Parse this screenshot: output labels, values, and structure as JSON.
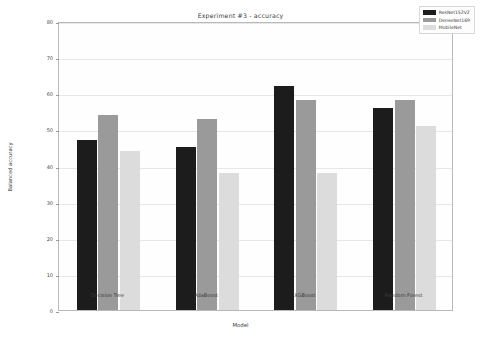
{
  "chart_data": {
    "type": "bar",
    "title": "Experiment #3 - accuracy",
    "xlabel": "Model",
    "ylabel": "Balanced accuracy",
    "categories": [
      "Decision Tree",
      "AdaBoost",
      "XGBoost",
      "Random Forest"
    ],
    "series": [
      {
        "name": "ResNet152V2",
        "values": [
          47,
          45,
          62,
          56
        ],
        "color": "#1c1c1c"
      },
      {
        "name": "DenseNet169",
        "values": [
          54,
          53,
          58,
          58
        ],
        "color": "#9a9a9a"
      },
      {
        "name": "MobileNet",
        "values": [
          44,
          38,
          38,
          51
        ],
        "color": "#dcdcdc"
      }
    ],
    "ylim": [
      0,
      80
    ],
    "yticks": [
      0,
      10,
      20,
      30,
      40,
      50,
      60,
      70,
      80
    ],
    "ytick_labels": [
      "0",
      "10",
      "20",
      "30",
      "40",
      "50",
      "60",
      "70",
      "80"
    ],
    "grid": true,
    "legend_position": "top-right"
  }
}
